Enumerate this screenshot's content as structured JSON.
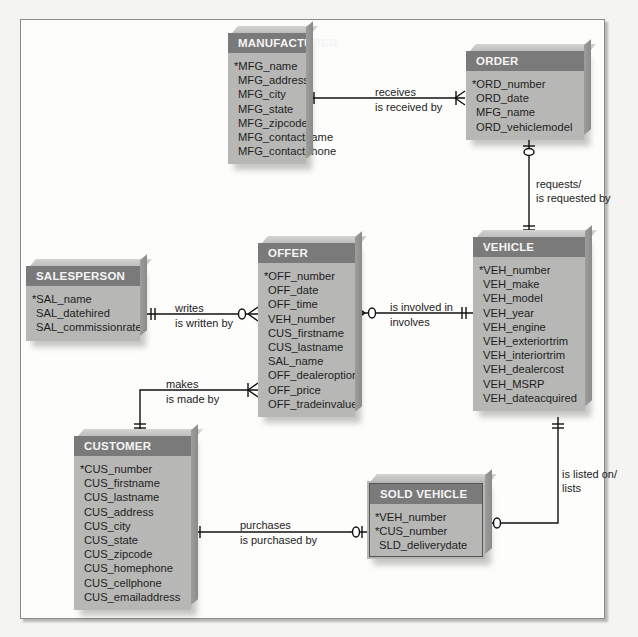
{
  "entities": {
    "manufacturer": {
      "name": "MANUFACTURER",
      "attributes": [
        "*MFG_name",
        "MFG_address",
        "MFG_city",
        "MFG_state",
        "MFG_zipcode",
        "MFG_contactname",
        "MFG_contactphone"
      ]
    },
    "order": {
      "name": "ORDER",
      "attributes": [
        "*ORD_number",
        "ORD_date",
        "MFG_name",
        "ORD_vehiclemodel"
      ]
    },
    "salesperson": {
      "name": "SALESPERSON",
      "attributes": [
        "*SAL_name",
        "SAL_datehired",
        "SAL_commissionrate"
      ]
    },
    "offer": {
      "name": "OFFER",
      "attributes": [
        "*OFF_number",
        "OFF_date",
        "OFF_time",
        "VEH_number",
        "CUS_firstname",
        "CUS_lastname",
        "SAL_name",
        "OFF_dealeroption",
        "OFF_price",
        "OFF_tradeinvalue"
      ]
    },
    "vehicle": {
      "name": "VEHICLE",
      "attributes": [
        "*VEH_number",
        "VEH_make",
        "VEH_model",
        "VEH_year",
        "VEH_engine",
        "VEH_exteriortrim",
        "VEH_interiortrim",
        "VEH_dealercost",
        "VEH_MSRP",
        "VEH_dateacquired"
      ]
    },
    "customer": {
      "name": "CUSTOMER",
      "attributes": [
        "*CUS_number",
        "CUS_firstname",
        "CUS_lastname",
        "CUS_address",
        "CUS_city",
        "CUS_state",
        "CUS_zipcode",
        "CUS_homephone",
        "CUS_cellphone",
        "CUS_emailaddress"
      ]
    },
    "sold_vehicle": {
      "name": "SOLD VEHICLE",
      "attributes": [
        "*VEH_number",
        "*CUS_number",
        "SLD_deliverydate"
      ]
    }
  },
  "relationships": {
    "receives": {
      "forward": "receives",
      "reverse": "is received by",
      "from": "MANUFACTURER",
      "to": "ORDER",
      "from_cardinality": "one-and-only-one",
      "to_cardinality": "one-or-many"
    },
    "requests": {
      "forward": "requests/",
      "reverse": "is requested by",
      "from": "ORDER",
      "to": "VEHICLE",
      "from_cardinality": "zero-or-one",
      "to_cardinality": "one-and-only-one"
    },
    "writes": {
      "forward": "writes",
      "reverse": "is written by",
      "from": "SALESPERSON",
      "to": "OFFER",
      "from_cardinality": "one-and-only-one",
      "to_cardinality": "zero-or-many"
    },
    "involved": {
      "forward": "is involved in",
      "reverse": "involves",
      "from": "OFFER",
      "to": "VEHICLE",
      "from_cardinality": "zero-or-many",
      "to_cardinality": "one-and-only-one"
    },
    "makes": {
      "forward": "makes",
      "reverse": "is made by",
      "from": "CUSTOMER",
      "to": "OFFER",
      "from_cardinality": "one-and-only-one",
      "to_cardinality": "one-or-many"
    },
    "purchases": {
      "forward": "purchases",
      "reverse": "is purchased by",
      "from": "CUSTOMER",
      "to": "SOLD VEHICLE",
      "from_cardinality": "one-and-only-one",
      "to_cardinality": "zero-or-one"
    },
    "listed": {
      "forward": "is listed on/",
      "reverse": "lists",
      "from": "VEHICLE",
      "to": "SOLD VEHICLE",
      "from_cardinality": "one-and-only-one",
      "to_cardinality": "zero-or-one"
    }
  },
  "colors": {
    "header": "#7b7a7b",
    "body": "#b7b7b5",
    "line": "#111111"
  }
}
